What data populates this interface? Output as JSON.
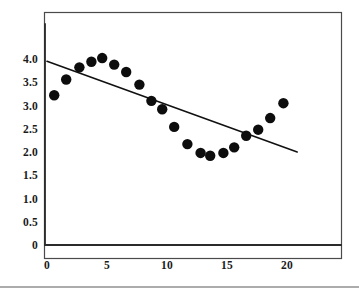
{
  "figure": {
    "background_color": "#ffffff",
    "frame": {
      "x": 44,
      "y": 12,
      "width": 297,
      "height": 246,
      "stroke": "#4a4a4a"
    },
    "bottom_rule_y": 287
  },
  "chart_data": {
    "type": "scatter",
    "title": "",
    "subtitle": "",
    "xlabel": "",
    "ylabel": "",
    "xlim": [
      0,
      24.5
    ],
    "ylim": [
      0,
      5.3
    ],
    "grid": false,
    "legend": null,
    "xticks": [
      0,
      5,
      10,
      15,
      20
    ],
    "xtick_labels": [
      "0",
      "5",
      "10",
      "15",
      "20"
    ],
    "yticks": [
      0,
      0.5,
      1.0,
      1.5,
      2.0,
      2.5,
      3.0,
      3.5,
      4.0
    ],
    "ytick_labels": [
      "0",
      "0.5",
      "1.0",
      "1.5",
      "2.0",
      "2.5",
      "3.0",
      "3.5",
      "4.0"
    ],
    "marker": "filled-circle",
    "marker_color": "#0d0d0d",
    "marker_size_px": 5.2,
    "x": [
      0.6,
      1.6,
      2.7,
      3.7,
      4.6,
      5.6,
      6.6,
      7.7,
      8.7,
      9.6,
      10.6,
      11.7,
      12.8,
      13.6,
      14.7,
      15.6,
      16.6,
      17.6,
      18.6,
      19.7
    ],
    "y": [
      3.22,
      3.56,
      3.82,
      3.94,
      4.02,
      3.88,
      3.72,
      3.45,
      3.1,
      2.92,
      2.54,
      2.17,
      1.98,
      1.92,
      1.98,
      2.1,
      2.35,
      2.48,
      2.73,
      3.05
    ],
    "series": [
      {
        "name": "observations",
        "type": "scatter",
        "points": [
          {
            "x": 0.6,
            "y": 3.22
          },
          {
            "x": 1.6,
            "y": 3.56
          },
          {
            "x": 2.7,
            "y": 3.82
          },
          {
            "x": 3.7,
            "y": 3.94
          },
          {
            "x": 4.6,
            "y": 4.02
          },
          {
            "x": 5.6,
            "y": 3.88
          },
          {
            "x": 6.6,
            "y": 3.72
          },
          {
            "x": 7.7,
            "y": 3.45
          },
          {
            "x": 8.7,
            "y": 3.1
          },
          {
            "x": 9.6,
            "y": 2.92
          },
          {
            "x": 10.6,
            "y": 2.54
          },
          {
            "x": 11.7,
            "y": 2.17
          },
          {
            "x": 12.8,
            "y": 1.98
          },
          {
            "x": 13.6,
            "y": 1.92
          },
          {
            "x": 14.7,
            "y": 1.98
          },
          {
            "x": 15.6,
            "y": 2.1
          },
          {
            "x": 16.6,
            "y": 2.35
          },
          {
            "x": 17.6,
            "y": 2.48
          },
          {
            "x": 18.6,
            "y": 2.73
          },
          {
            "x": 19.7,
            "y": 3.05
          }
        ]
      },
      {
        "name": "fitted-regression-line",
        "type": "line",
        "color": "#111111",
        "x0": 0.0,
        "y0": 3.95,
        "x1": 20.85,
        "y1": 2.0
      }
    ]
  }
}
